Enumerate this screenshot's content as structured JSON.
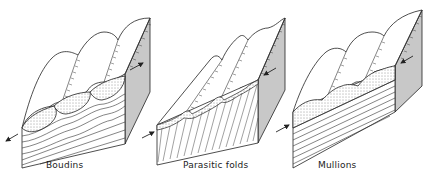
{
  "figure": {
    "colors": {
      "line": "#222222",
      "side_face_shade": "#c8c8c8",
      "background": "#ffffff"
    },
    "panels": [
      {
        "id": "boudins",
        "label": "Boudins",
        "arrows": [
          "extension-left",
          "extension-right"
        ],
        "features": [
          "three lens-shaped stippled boudins",
          "wavy bedding on front face",
          "shaded side face"
        ]
      },
      {
        "id": "parasitic-folds",
        "label": "Parasitic folds",
        "arrows": [
          "compression-left",
          "compression-right"
        ],
        "features": [
          "three sharp parasitic fold crests",
          "diagonal hatching on front face",
          "shaded side face"
        ]
      },
      {
        "id": "mullions",
        "label": "Mullions",
        "arrows": [
          "compression-left",
          "compression-right"
        ],
        "features": [
          "three rounded mullion ridges",
          "stippled cusp layer",
          "parallel horizontal bedding",
          "shaded side face"
        ]
      }
    ]
  }
}
